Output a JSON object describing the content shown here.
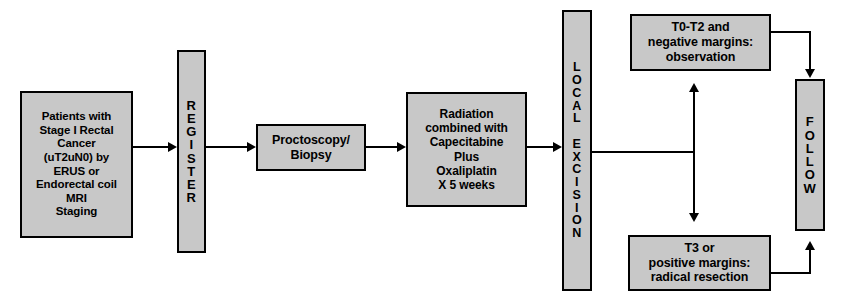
{
  "diagram": {
    "fill_color": "#c8c8c8",
    "border_color": "#000000",
    "background_color": "#ffffff",
    "nodes": {
      "patients": "Patients with\nStage I Rectal\nCancer\n(uT2uN0) by\nERUS or\nEndorectal coil\nMRI\nStaging",
      "register": "R\nE\nG\nI\nS\nT\nE\nR",
      "proctoscopy": "Proctoscopy/\nBiopsy",
      "radiation": "Radiation\ncombined with\nCapecitabine\nPlus\nOxaliplatin\nX 5 weeks",
      "local_excision": "L\nO\nC\nA\nL\n\nE\nX\nC\nI\nS\nI\nO\nN",
      "observation": "T0-T2 and\nnegative margins:\nobservation",
      "radical_resection": "T3 or\npositive margins:\nradical resection",
      "follow": "F\nO\nL\nL\nO\nW"
    },
    "edges": [
      {
        "name": "patients-to-register",
        "from": "patients",
        "to": "register",
        "style": "arrow"
      },
      {
        "name": "register-to-proctoscopy",
        "from": "register",
        "to": "proctoscopy",
        "style": "arrow"
      },
      {
        "name": "proctoscopy-to-radiation",
        "from": "proctoscopy",
        "to": "radiation",
        "style": "arrow"
      },
      {
        "name": "radiation-to-local-excision",
        "from": "radiation",
        "to": "local_excision",
        "style": "arrow"
      },
      {
        "name": "local-excision-to-observation",
        "from": "local_excision",
        "to": "observation",
        "style": "branch-up-arrow"
      },
      {
        "name": "local-excision-to-radical-resection",
        "from": "local_excision",
        "to": "radical_resection",
        "style": "branch-down-arrow"
      },
      {
        "name": "observation-to-follow",
        "from": "observation",
        "to": "follow",
        "style": "arrow"
      },
      {
        "name": "radical-resection-to-follow",
        "from": "radical_resection",
        "to": "follow",
        "style": "arrow"
      }
    ]
  }
}
